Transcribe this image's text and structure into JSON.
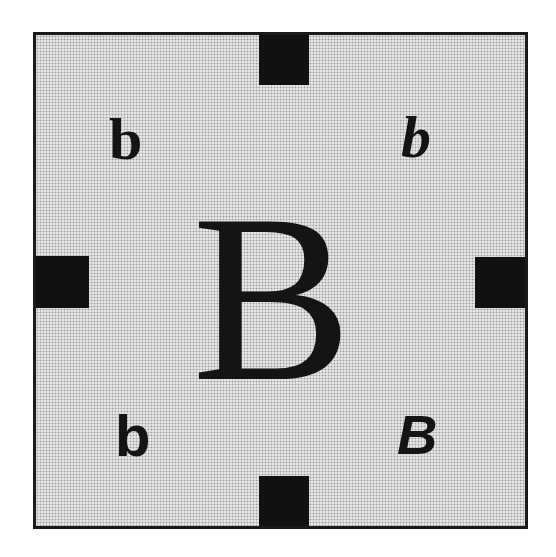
{
  "diagram": {
    "center_letter": "B",
    "corners": {
      "top_left": "b",
      "top_right": "b",
      "bottom_left": "b",
      "bottom_right": "B"
    },
    "colors": {
      "border": "#1a1a1a",
      "tabs": "#111111",
      "background_pattern": "#e4e4e4",
      "text": "#141414"
    }
  }
}
